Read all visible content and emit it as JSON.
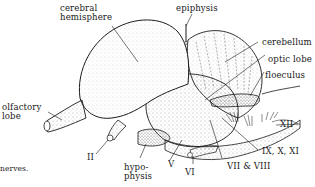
{
  "figure": {
    "caption_fragment": "nerves."
  },
  "labels": {
    "cerebral_hemisphere": [
      "cerebral",
      "hemisphere"
    ],
    "epiphysis": "epiphysis",
    "cerebellum": "cerebellum",
    "optic_lobe": "optic lobe",
    "floeculus": "floeculus",
    "olfactory_lobe": [
      "olfactory",
      "lobe"
    ],
    "nerve_II": "II",
    "hypophysis": [
      "hypo-",
      "physis"
    ],
    "nerve_V": "V",
    "nerve_VI": "VI",
    "nerve_VII_VIII": "VII & VIII",
    "nerve_IX_X_XI": "IX, X, XI",
    "nerve_XII": "XII"
  },
  "colors": {
    "ink": "#1a1a1a",
    "background": "#ffffff"
  }
}
